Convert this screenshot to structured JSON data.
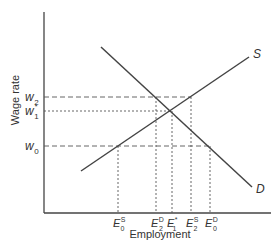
{
  "diagram": {
    "type": "labor-market-supply-demand",
    "axes": {
      "ylabel": "Wage rate",
      "xlabel": "Employment"
    },
    "curves": {
      "supply": {
        "label": "S",
        "x1": 81,
        "y1": 171,
        "x2": 249,
        "y2": 57
      },
      "demand": {
        "label": "D",
        "x1": 101,
        "y1": 47,
        "x2": 252,
        "y2": 187
      }
    },
    "wage_levels": [
      {
        "id": "w2",
        "base": "w",
        "sub": "2",
        "sup": "",
        "y": 97,
        "style": "dashed",
        "x_end": 191
      },
      {
        "id": "w1",
        "base": "w",
        "sub": "1",
        "sup": "*",
        "y": 111,
        "style": "dotted",
        "x_end": 172
      },
      {
        "id": "w0",
        "base": "w",
        "sub": "0",
        "sup": "",
        "y": 146,
        "style": "dashed",
        "x_end": 210
      }
    ],
    "employment_levels": [
      {
        "id": "E0S",
        "base": "E",
        "sub": "0",
        "sup": "S",
        "x": 118,
        "y_top": 146
      },
      {
        "id": "E2D",
        "base": "E",
        "sub": "2",
        "sup": "D",
        "x": 156,
        "y_top": 97
      },
      {
        "id": "E1",
        "base": "E",
        "sub": "1",
        "sup": "*",
        "x": 172,
        "y_top": 111
      },
      {
        "id": "E2S",
        "base": "E",
        "sub": "2",
        "sup": "S",
        "x": 191,
        "y_top": 97
      },
      {
        "id": "E0D",
        "base": "E",
        "sub": "0",
        "sup": "D",
        "x": 210,
        "y_top": 146
      }
    ],
    "colors": {
      "line": "#444444",
      "guide": "#555555",
      "text": "#333333"
    }
  }
}
